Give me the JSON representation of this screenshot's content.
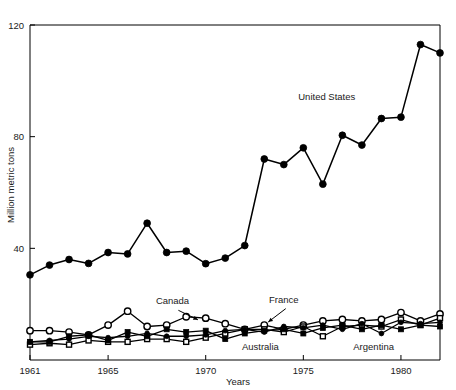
{
  "chart_data": {
    "type": "line",
    "title": "",
    "xlabel": "Years",
    "ylabel": "Million metric tons",
    "xlim": [
      1961,
      1982
    ],
    "ylim": [
      0,
      120
    ],
    "ytick_values": [
      40,
      80,
      120
    ],
    "ytick_labels": [
      "40",
      "80",
      "120"
    ],
    "xtick_values": [
      1961,
      1965,
      1970,
      1975,
      1980
    ],
    "xtick_labels": [
      "1961",
      "1965",
      "1970",
      "1975",
      "1980"
    ],
    "grid": false,
    "legend_position": "inline-annotations",
    "x": [
      1961,
      1962,
      1963,
      1964,
      1965,
      1966,
      1967,
      1968,
      1969,
      1970,
      1971,
      1972,
      1973,
      1974,
      1975,
      1976,
      1977,
      1978,
      1979,
      1980,
      1981,
      1982
    ],
    "series": [
      {
        "name": "United States",
        "marker": "filled-circle",
        "marker_size": 3.4,
        "values": [
          30.5,
          34.0,
          36.0,
          34.6,
          38.5,
          38.0,
          49.0,
          38.5,
          39.0,
          34.5,
          36.5,
          41.0,
          72.0,
          70.0,
          76.0,
          63.0,
          80.5,
          77.0,
          86.5,
          87.0,
          113.0,
          110.0
        ],
        "label_x": 1976.2,
        "label_y": 93.0
      },
      {
        "name": "Canada",
        "marker": "open-circle",
        "marker_size": 3.2,
        "values": [
          10.5,
          10.5,
          10.0,
          9.0,
          12.5,
          17.5,
          12.0,
          12.5,
          15.5,
          15.0,
          13.0,
          11.0,
          12.5,
          11.0,
          12.5,
          14.0,
          14.5,
          14.0,
          14.5,
          17.0,
          14.0,
          16.5
        ],
        "label_x": 1968.3,
        "label_y": 20.0,
        "leader": {
          "x1": 1968.6,
          "y1": 17.8,
          "x2": 1969.6,
          "y2": 14.4
        }
      },
      {
        "name": "France",
        "marker": "open-square",
        "marker_size": 5.0,
        "values": [
          5.5,
          6.0,
          5.5,
          7.0,
          6.5,
          6.5,
          7.5,
          7.5,
          6.5,
          8.0,
          9.5,
          11.0,
          11.0,
          10.0,
          12.0,
          8.5,
          12.0,
          12.5,
          12.0,
          14.5,
          12.5,
          15.0
        ],
        "label_x": 1974.0,
        "label_y": 20.5,
        "leader": {
          "x1": 1974.1,
          "y1": 18.4,
          "x2": 1973.2,
          "y2": 13.6
        }
      },
      {
        "name": "Australia",
        "marker": "filled-square",
        "marker_size": 5.0,
        "values": [
          6.5,
          6.5,
          8.5,
          9.0,
          7.0,
          10.0,
          8.5,
          11.0,
          10.0,
          10.5,
          7.5,
          9.5,
          10.5,
          11.0,
          9.5,
          11.5,
          12.5,
          11.0,
          12.5,
          11.0,
          12.5,
          12.0
        ],
        "label_x": 1972.8,
        "label_y": 3.5
      },
      {
        "name": "Argentina",
        "marker": "small-filled-circle",
        "marker_size": 2.4,
        "values": [
          6.5,
          7.0,
          7.5,
          8.5,
          8.0,
          8.5,
          9.5,
          8.5,
          8.5,
          9.0,
          10.5,
          11.0,
          10.0,
          12.0,
          11.5,
          12.5,
          11.0,
          13.0,
          9.5,
          13.5,
          13.0,
          13.5
        ],
        "label_x": 1978.6,
        "label_y": 3.5
      }
    ]
  },
  "colors": {
    "ink": "#000000",
    "background": "#ffffff"
  }
}
